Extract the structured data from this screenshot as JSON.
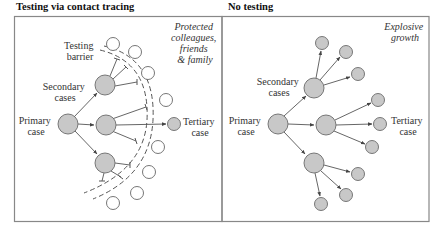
{
  "panels": [
    {
      "title": "Testing via contact tracing",
      "labels": {
        "primary": [
          "Primary",
          "case"
        ],
        "secondary": [
          "Secondary",
          "cases"
        ],
        "tertiary": [
          "Tertiary",
          "case"
        ],
        "barrier": [
          "Testing",
          "barrier"
        ],
        "note": [
          "Protected",
          "colleagues,",
          "friends",
          "& family"
        ]
      }
    },
    {
      "title": "No testing",
      "labels": {
        "primary": [
          "Primary",
          "case"
        ],
        "secondary": [
          "Secondary",
          "cases"
        ],
        "tertiary": [
          "Tertiary",
          "case"
        ],
        "note": [
          "Explosive",
          "growth"
        ]
      }
    }
  ],
  "colors": {
    "infected_fill": "#c8c8c8",
    "node_stroke": "#6a6a6a",
    "healthy_fill": "#ffffff",
    "frame": "#888888",
    "line": "#555555"
  }
}
